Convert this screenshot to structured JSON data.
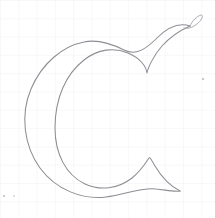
{
  "document": {
    "kind": "hand-drawn-letterform-sketch",
    "subject_glyph": "C",
    "subject_description": "Outline drawing of a serif capital letter C",
    "medium": "pencil line drawing on graph paper",
    "canvas": {
      "width": 215,
      "height": 218
    }
  },
  "paper": {
    "background_color": "#ffffff",
    "grid_line_color": "#f1f1f5",
    "grid_spacing_px": 18.3,
    "grid_visible": true
  },
  "ink": {
    "primary_stroke_color": "#8d8d94",
    "secondary_stroke_color": "#a2a2a9",
    "speck_color": "#b9b9c0",
    "stroke_width_px": 1.05
  },
  "glyph": {
    "letter": "C",
    "style": "serif capital with ball terminal and spur",
    "bounds": {
      "left": 21,
      "top": 10,
      "right": 202,
      "bottom": 199
    },
    "features": [
      {
        "name": "outer-bowl-curve",
        "label": "Outer bowl curve",
        "description": "Large open left-facing arc forming the outside of the C"
      },
      {
        "name": "inner-bowl-curve",
        "label": "Inner counter curve",
        "description": "Inner arc defining the counter of the C, thick at left, thin at top and bottom"
      },
      {
        "name": "top-ball-terminal",
        "label": "Top ball terminal",
        "description": "Hooked teardrop loop at the upper right end of the stroke",
        "anchor": {
          "x": 190,
          "y": 18
        }
      },
      {
        "name": "top-spur",
        "label": "Top spur point",
        "description": "Sharp downward point where the outer and inner curves meet below the ball terminal",
        "anchor": {
          "x": 147,
          "y": 73
        }
      },
      {
        "name": "bottom-spur-serif",
        "label": "Bottom spur serif",
        "description": "Triangular beak serif at the lower right terminal of the C",
        "anchor": {
          "x": 153,
          "y": 158
        }
      }
    ],
    "paths": {
      "outer": "M 190 26 C 178 22 167 28 157 38 C 146 49 136 56 124 50 C 112 44 98 39 84 42 C 63 46 42 63 31 89 C 20 115 24 146 40 168 C 56 190 83 200 106 197 C 126 194 143 187 156 189 C 166 190 174 192 180 191",
      "inner": "M 180 191 C 170 186 161 176 155 166 C 151 159 150 157 149 158 C 147 161 141 171 132 178 C 118 189 100 191 85 184 C 66 175 55 154 55 128 C 55 98 66 74 84 60 C 98 49 114 47 128 53 C 140 58 146 66 147 73 C 148 68 153 56 162 46 C 171 36 181 30 190 26",
      "ball_loop": "M 190 26 C 192 21 197 16 201 15 C 204 15 202 20 197 24 C 192 28 187 29 184 28"
    }
  },
  "annotations": {
    "speck_marks": [
      {
        "x": 203,
        "y": 79,
        "r": 1.1
      },
      {
        "x": 4,
        "y": 196,
        "r": 1.0
      },
      {
        "x": 14,
        "y": 196,
        "r": 0.8
      }
    ]
  }
}
